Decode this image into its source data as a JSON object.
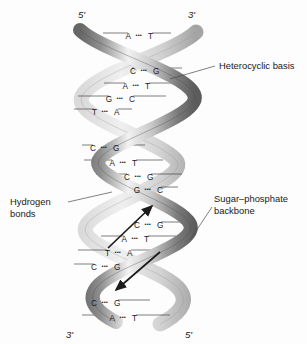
{
  "figure": {
    "background_color": "#fdfdfd",
    "width": 307,
    "height": 344
  },
  "bond_symbol": "▪▪▪",
  "terminals": [
    {
      "name": "top-left",
      "label": "5'",
      "x": 78,
      "y": 18
    },
    {
      "name": "top-right",
      "label": "3'",
      "x": 188,
      "y": 18
    },
    {
      "name": "bottom-left",
      "label": "3'",
      "x": 66,
      "y": 332
    },
    {
      "name": "bottom-right",
      "label": "5'",
      "x": 185,
      "y": 332
    }
  ],
  "base_pairs": [
    {
      "left": "A",
      "right": "T",
      "y": 36,
      "cx": 139,
      "rule_left": 103,
      "rule_right": 171
    },
    {
      "left": "C",
      "right": "G",
      "y": 71,
      "cx": 144,
      "rule_left": 132,
      "rule_right": 182
    },
    {
      "left": "A",
      "right": "T",
      "y": 86,
      "cx": 136,
      "rule_left": 104,
      "rule_right": 178
    },
    {
      "left": "G",
      "right": "C",
      "y": 99,
      "cx": 120,
      "rule_left": 78,
      "rule_right": 166
    },
    {
      "left": "T",
      "right": "A",
      "y": 112,
      "cx": 105,
      "rule_left": 74,
      "rule_right": 132
    },
    {
      "left": "C",
      "right": "G",
      "y": 148,
      "cx": 104,
      "rule_left": 82,
      "rule_right": 145
    },
    {
      "left": "A",
      "right": "T",
      "y": 163,
      "cx": 123,
      "rule_left": 84,
      "rule_right": 163
    },
    {
      "left": "C",
      "right": "G",
      "y": 177,
      "cx": 138,
      "rule_left": 96,
      "rule_right": 182
    },
    {
      "left": "G",
      "right": "C",
      "y": 190,
      "cx": 148,
      "rule_left": 116,
      "rule_right": 178
    },
    {
      "left": "C",
      "right": "G",
      "y": 225,
      "cx": 148,
      "rule_left": 134,
      "rule_right": 186
    },
    {
      "left": "A",
      "right": "T",
      "y": 239,
      "cx": 135,
      "rule_left": 101,
      "rule_right": 176
    },
    {
      "left": "T",
      "right": "A",
      "y": 253,
      "cx": 118,
      "rule_left": 78,
      "rule_right": 164
    },
    {
      "left": "C",
      "right": "G",
      "y": 267,
      "cx": 105,
      "rule_left": 74,
      "rule_right": 140
    },
    {
      "left": "C",
      "right": "G",
      "y": 303,
      "cx": 105,
      "rule_left": 86,
      "rule_right": 150
    },
    {
      "left": "A",
      "right": "T",
      "y": 318,
      "cx": 123,
      "rule_left": 82,
      "rule_right": 170
    }
  ],
  "annotations": [
    {
      "name": "heterocyclic-basis",
      "lines": [
        "Heterocyclic basis"
      ],
      "text_x": 219,
      "text_y": 68,
      "leader": "M 215 66 L 170 79"
    },
    {
      "name": "hydrogen-bonds",
      "lines": [
        "Hydrogen",
        "bonds"
      ],
      "text_x": 10,
      "text_y": 205,
      "leader": "M 68 202 L 112 192"
    },
    {
      "name": "sugar-phosphate-backbone",
      "lines": [
        "Sugar–phosphate",
        "backbone"
      ],
      "text_x": 214,
      "text_y": 202,
      "leader": "M 212 207 L 190 238"
    }
  ],
  "strand_arrows": [
    {
      "name": "upward-arrow",
      "direction": "up-right"
    },
    {
      "name": "downward-arrow",
      "direction": "down-left"
    }
  ],
  "colors": {
    "ribbon_dark": "#6f6f6f",
    "ribbon_mid": "#a9a9a9",
    "ribbon_light": "#e2e2e2",
    "outline": "#4a4a4a",
    "text": "#1a1a1a"
  }
}
